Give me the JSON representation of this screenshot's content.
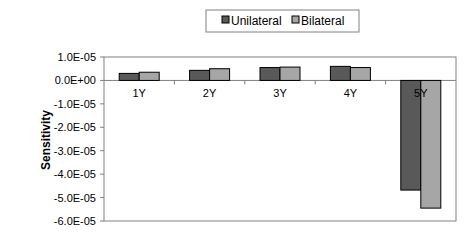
{
  "chart_data": {
    "type": "bar",
    "title": "",
    "xlabel": "",
    "ylabel": "Sensitivity",
    "ylim": [
      -6e-05,
      1e-05
    ],
    "yticks": [
      1e-05,
      0,
      -1e-05,
      -2e-05,
      -3e-05,
      -4e-05,
      -5e-05,
      -6e-05
    ],
    "ytick_labels": [
      "1.0E-05",
      "0.0E+00",
      "-1.0E-05",
      "-2.0E-05",
      "-3.0E-05",
      "-4.0E-05",
      "-5.0E-05",
      "-6.0E-05"
    ],
    "categories": [
      "1Y",
      "2Y",
      "3Y",
      "4Y",
      "5Y"
    ],
    "series": [
      {
        "name": "Unilateral",
        "color": "#595959",
        "values": [
          3e-06,
          4.3e-06,
          5.5e-06,
          6e-06,
          -4.68e-05
        ]
      },
      {
        "name": "Bilateral",
        "color": "#a6a6a6",
        "values": [
          3.5e-06,
          5e-06,
          5.7e-06,
          5.5e-06,
          -5.45e-05
        ]
      }
    ],
    "legend": "top",
    "grid": false
  }
}
